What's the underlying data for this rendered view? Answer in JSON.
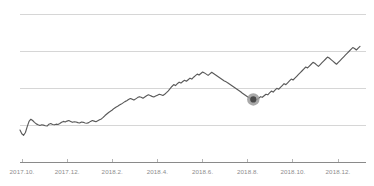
{
  "chart_data": {
    "type": "line",
    "title": "",
    "subtitle": "",
    "xlabel": "",
    "ylabel": "",
    "grid": true,
    "gridlines_y": [
      4,
      3,
      2,
      1
    ],
    "legend": "none",
    "xlim": [
      "2017.10",
      "2019.01"
    ],
    "ylim": [
      0,
      5
    ],
    "axis_color": "#8a8a8a",
    "grid_color": "#d6d6d6",
    "line_color": "#5a5a5a",
    "marker_color": "#4a4a4a",
    "marker_halo_color": "#9a9a9a",
    "background_color": "#ffffff",
    "tick_labels": [
      "2017.10.",
      "2017.12.",
      "2018.2.",
      "2018.4.",
      "2018.6.",
      "2018.8.",
      "2018.10.",
      "2018.12."
    ],
    "annotations": [
      {
        "name": "highlight-point",
        "x": 0.685,
        "y": 2.04,
        "label": ""
      }
    ],
    "series": [
      {
        "name": "price",
        "values": [
          1.05,
          0.93,
          0.88,
          0.97,
          1.16,
          1.33,
          1.4,
          1.36,
          1.3,
          1.25,
          1.22,
          1.2,
          1.22,
          1.21,
          1.19,
          1.18,
          1.24,
          1.26,
          1.23,
          1.22,
          1.24,
          1.23,
          1.26,
          1.3,
          1.33,
          1.31,
          1.34,
          1.36,
          1.33,
          1.3,
          1.32,
          1.31,
          1.29,
          1.28,
          1.31,
          1.3,
          1.28,
          1.27,
          1.29,
          1.33,
          1.36,
          1.34,
          1.32,
          1.35,
          1.38,
          1.41,
          1.46,
          1.52,
          1.57,
          1.62,
          1.66,
          1.7,
          1.75,
          1.79,
          1.82,
          1.86,
          1.89,
          1.93,
          1.97,
          2.0,
          2.04,
          2.07,
          2.05,
          2.02,
          2.06,
          2.1,
          2.13,
          2.11,
          2.08,
          2.12,
          2.16,
          2.19,
          2.17,
          2.14,
          2.12,
          2.15,
          2.18,
          2.21,
          2.19,
          2.17,
          2.21,
          2.26,
          2.32,
          2.39,
          2.46,
          2.52,
          2.49,
          2.55,
          2.6,
          2.57,
          2.62,
          2.66,
          2.63,
          2.68,
          2.73,
          2.7,
          2.76,
          2.81,
          2.86,
          2.83,
          2.88,
          2.93,
          2.9,
          2.86,
          2.82,
          2.87,
          2.92,
          2.88,
          2.84,
          2.8,
          2.76,
          2.72,
          2.68,
          2.64,
          2.61,
          2.57,
          2.53,
          2.49,
          2.45,
          2.41,
          2.37,
          2.33,
          2.29,
          2.24,
          2.2,
          2.16,
          2.12,
          2.09,
          2.06,
          2.04,
          2.03,
          2.04,
          2.08,
          2.13,
          2.11,
          2.16,
          2.21,
          2.19,
          2.25,
          2.31,
          2.28,
          2.34,
          2.4,
          2.37,
          2.43,
          2.49,
          2.55,
          2.52,
          2.58,
          2.64,
          2.7,
          2.67,
          2.73,
          2.79,
          2.85,
          2.91,
          2.97,
          3.03,
          3.09,
          3.06,
          3.12,
          3.18,
          3.24,
          3.21,
          3.16,
          3.11,
          3.17,
          3.23,
          3.29,
          3.35,
          3.41,
          3.38,
          3.33,
          3.28,
          3.23,
          3.18,
          3.24,
          3.3,
          3.36,
          3.42,
          3.48,
          3.54,
          3.6,
          3.66,
          3.72,
          3.69,
          3.64,
          3.7,
          3.76
        ]
      }
    ]
  }
}
